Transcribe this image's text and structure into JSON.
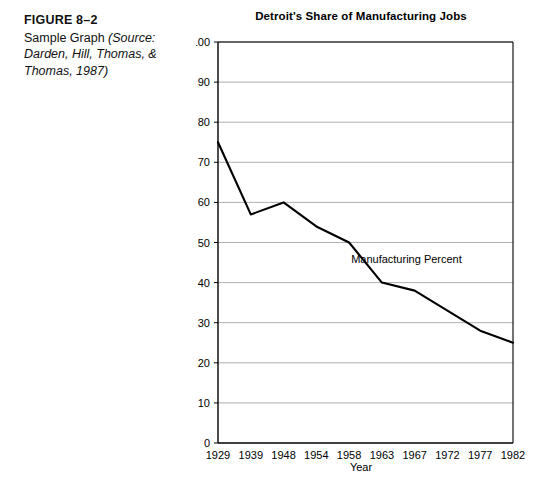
{
  "caption": {
    "figure_label": "FIGURE 8–2",
    "text_plain": "Sample Graph ",
    "text_italic": "(Source: Darden, Hill, Thomas, & Thomas, 1987)"
  },
  "chart_data": {
    "type": "line",
    "title": "Detroit's Share of Manufacturing Jobs",
    "xlabel": "Year",
    "ylabel": "",
    "categories": [
      "1929",
      "1939",
      "1948",
      "1954",
      "1958",
      "1963",
      "1967",
      "1972",
      "1977",
      "1982"
    ],
    "x": [
      1929,
      1939,
      1948,
      1954,
      1958,
      1963,
      1967,
      1972,
      1977,
      1982
    ],
    "values": [
      75,
      57,
      60,
      54,
      50,
      40,
      38,
      33,
      28,
      25
    ],
    "series": [
      {
        "name": "Manufacturing Percent",
        "values": [
          75,
          57,
          60,
          54,
          50,
          40,
          38,
          33,
          28,
          25
        ]
      }
    ],
    "annotations": [
      {
        "text": "Manufacturing Percent",
        "x": 1966,
        "y": 45
      }
    ],
    "ylim": [
      0,
      100
    ],
    "ytick_step": 10,
    "yticks": [
      "0",
      "10",
      "20",
      "30",
      "40",
      "50",
      "60",
      "70",
      "80",
      "90",
      "100"
    ],
    "grid": "horizontal",
    "legend": "none",
    "line_color": "#000000",
    "grid_color": "#9a9a9a",
    "axis_color": "#000000"
  },
  "colors": {
    "background": "#ffffff",
    "text": "#000000",
    "line": "#000000",
    "grid": "#9a9a9a"
  }
}
